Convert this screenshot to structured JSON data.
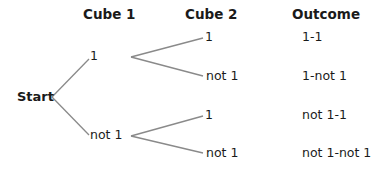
{
  "headers": {
    "cube1": "Cube 1",
    "cube2": "Cube 2",
    "outcome": "Outcome"
  },
  "root": {
    "label": "Start"
  },
  "cube1": [
    {
      "label": "1"
    },
    {
      "label": "not 1"
    }
  ],
  "cube2": [
    {
      "label": "1",
      "parent": 0
    },
    {
      "label": "not 1",
      "parent": 0
    },
    {
      "label": "1",
      "parent": 1
    },
    {
      "label": "not 1",
      "parent": 1
    }
  ],
  "outcomes": [
    {
      "label": "1-1"
    },
    {
      "label": "1-not 1"
    },
    {
      "label": "not 1-1"
    },
    {
      "label": "not 1-not 1"
    }
  ],
  "colors": {
    "line": "#8a8a8a",
    "text": "#1a1a1a"
  }
}
